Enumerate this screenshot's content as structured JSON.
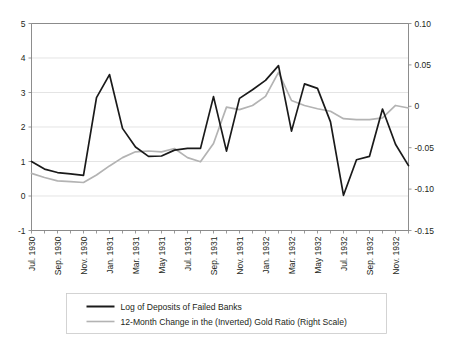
{
  "chart_data": {
    "type": "line",
    "title": "",
    "subtitle": "",
    "xlabel": "",
    "ylabel": "",
    "y2label": "",
    "ylim": [
      -1,
      5
    ],
    "y2lim": [
      -0.15,
      0.1
    ],
    "yticks": [
      "5",
      "4",
      "3",
      "2",
      "1",
      "0",
      "-1"
    ],
    "ytick_values": [
      5,
      4,
      3,
      2,
      1,
      0,
      -1
    ],
    "y2ticks": [
      "0.10",
      "0.05",
      "0",
      "-0.05",
      "-0.10",
      "-0.15"
    ],
    "y2tick_values": [
      0.1,
      0.05,
      0,
      -0.05,
      -0.1,
      -0.15
    ],
    "grid": true,
    "legend_position": "bottom",
    "x": [
      "Jul. 1930",
      "Aug. 1930",
      "Sep. 1930",
      "Oct. 1930",
      "Nov. 1930",
      "Dec. 1930",
      "Jan. 1931",
      "Feb. 1931",
      "Mar. 1931",
      "Apr. 1931",
      "May 1931",
      "Jun. 1931",
      "Jul. 1931",
      "Aug. 1931",
      "Sep. 1931",
      "Oct. 1931",
      "Nov. 1931",
      "Dec. 1931",
      "Jan. 1932",
      "Feb. 1932",
      "Mar. 1932",
      "Apr. 1932",
      "May 1932",
      "Jun. 1932",
      "Jul. 1932",
      "Aug. 1932",
      "Sep. 1932",
      "Oct. 1932",
      "Nov. 1932",
      "Dec. 1932"
    ],
    "xtick_labels": [
      "Jul. 1930",
      "Sep. 1930",
      "Nov. 1930",
      "Jan. 1931",
      "Mar. 1931",
      "May 1931",
      "Jul. 1931",
      "Sep. 1931",
      "Nov. 1931",
      "Jan. 1932",
      "Mar. 1932",
      "May 1932",
      "Jul. 1932",
      "Sep. 1932",
      "Nov. 1932"
    ],
    "xtick_indices": [
      0,
      2,
      4,
      6,
      8,
      10,
      12,
      14,
      16,
      18,
      20,
      22,
      24,
      26,
      28
    ],
    "series": [
      {
        "name": "Log of Deposits of Failed Banks",
        "color": "#1a1a1a",
        "width": 1.7,
        "axis": "left",
        "values": [
          1.0,
          0.78,
          0.68,
          0.64,
          0.6,
          2.85,
          3.52,
          1.96,
          1.42,
          1.15,
          1.16,
          1.33,
          1.38,
          1.38,
          2.88,
          1.3,
          2.83,
          3.08,
          3.35,
          3.78,
          1.88,
          3.25,
          3.12,
          2.15,
          0.02,
          1.05,
          1.15,
          2.52,
          1.5,
          0.88
        ]
      },
      {
        "name": "12-Month Change in the (Inverted) Gold Ratio (Right Scale)",
        "color": "#b3b3b3",
        "width": 1.7,
        "axis": "right",
        "values": [
          -0.081,
          -0.086,
          -0.09,
          -0.091,
          -0.092,
          -0.083,
          -0.072,
          -0.062,
          -0.055,
          -0.054,
          -0.055,
          -0.051,
          -0.062,
          -0.067,
          -0.045,
          -0.001,
          -0.004,
          0.001,
          0.012,
          0.041,
          0.007,
          0.001,
          -0.003,
          -0.006,
          -0.015,
          -0.016,
          -0.016,
          -0.014,
          0.001,
          -0.002
        ]
      }
    ],
    "series_right_tail": {
      "note": "gold ratio continues to Dec 1932",
      "values_tail": [
        -0.045,
        -0.118,
        -0.116,
        -0.113
      ]
    }
  },
  "legend": {
    "entries": [
      {
        "label": "Log of Deposits of Failed Banks",
        "color": "#1a1a1a"
      },
      {
        "label": "12-Month Change in the (Inverted) Gold Ratio (Right Scale)",
        "color": "#b3b3b3"
      }
    ]
  },
  "colors": {
    "black_series": "#1a1a1a",
    "gray_series": "#b3b3b3",
    "gridline": "#d9d9d9",
    "axis": "#808080",
    "text": "#231f20",
    "background": "#ffffff"
  }
}
